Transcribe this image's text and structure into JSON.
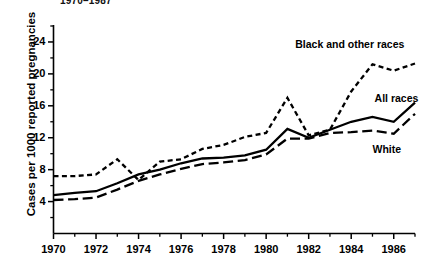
{
  "chart_data": {
    "type": "line",
    "title": "1970–1987",
    "xlabel": "",
    "ylabel": "Cases per 1000 reported pregnancies",
    "xlim": [
      1970,
      1987
    ],
    "ylim": [
      0,
      26
    ],
    "grid": false,
    "legend_position": "inline-annotations",
    "x": [
      1970,
      1971,
      1972,
      1973,
      1974,
      1975,
      1976,
      1977,
      1978,
      1979,
      1980,
      1981,
      1982,
      1983,
      1984,
      1985,
      1986,
      1987
    ],
    "xticks_major": [
      1970,
      1972,
      1974,
      1976,
      1978,
      1980,
      1982,
      1984,
      1986
    ],
    "xticks_minor": [
      1971,
      1973,
      1975,
      1977,
      1979,
      1981,
      1983,
      1985,
      1987
    ],
    "yticks_major": [
      4,
      8,
      12,
      16,
      20,
      24
    ],
    "yticks_minor": [
      2,
      6,
      10,
      14,
      18,
      22,
      26
    ],
    "series": [
      {
        "name": "Black and other races",
        "style": "short-dashed",
        "values": [
          7.2,
          7.2,
          7.4,
          9.3,
          6.7,
          9.0,
          9.3,
          10.6,
          11.1,
          12.1,
          12.6,
          17.0,
          12.3,
          13.0,
          17.8,
          21.2,
          20.4,
          21.3
        ]
      },
      {
        "name": "All races",
        "style": "solid",
        "values": [
          4.8,
          5.1,
          5.3,
          6.3,
          7.4,
          8.0,
          8.8,
          9.4,
          9.5,
          9.8,
          10.5,
          13.1,
          12.0,
          13.0,
          14.0,
          14.6,
          14.0,
          16.4
        ]
      },
      {
        "name": "White",
        "style": "long-dashed",
        "values": [
          4.2,
          4.3,
          4.5,
          5.5,
          6.6,
          7.4,
          8.1,
          8.7,
          8.9,
          9.2,
          9.9,
          11.9,
          11.9,
          12.6,
          12.7,
          12.9,
          12.5,
          15.0
        ]
      }
    ],
    "annotations": [
      {
        "text": "Black and other races",
        "x": 1984.0,
        "y": 23.6
      },
      {
        "text": "All races",
        "x": 1985.1,
        "y": 16.8
      },
      {
        "text": "White",
        "x": 1985.0,
        "y": 10.5
      }
    ]
  },
  "axis": {
    "y_tick_labels": [
      "24",
      "20",
      "16",
      "12",
      "8",
      "4"
    ],
    "x_tick_labels": [
      "1970",
      "1972",
      "1974",
      "1976",
      "1978",
      "1980",
      "1982",
      "1984",
      "1986"
    ]
  },
  "colors": {
    "ink": "#000000",
    "background": "#ffffff"
  }
}
